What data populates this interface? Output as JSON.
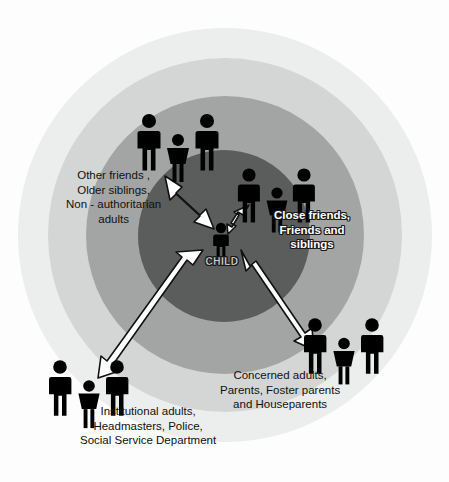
{
  "diagram": {
    "center": {
      "label": "CHILD",
      "icon": "child-figure-icon"
    },
    "rings": [
      {
        "name": "core-ring",
        "fill": "#5b5c5c",
        "order": 1
      },
      {
        "name": "inner-ring",
        "fill": "#a3a5a5",
        "order": 2
      },
      {
        "name": "middle-ring",
        "fill": "#d4d6d6",
        "order": 3
      },
      {
        "name": "outer-ring",
        "fill": "#eceded",
        "order": 4
      }
    ],
    "groups": [
      {
        "id": "close-friends",
        "icon": "people-group-icon",
        "caption_lines": [
          "Close friends,",
          "Friends and",
          "siblings"
        ],
        "ring": "inner-ring"
      },
      {
        "id": "other-friends",
        "icon": "people-group-icon",
        "caption_lines": [
          "Other friends ,",
          "Older siblings,",
          "Non - authoritarian",
          "adults"
        ],
        "ring": "middle-ring"
      },
      {
        "id": "concerned-adults",
        "icon": "people-group-icon",
        "caption_lines": [
          "Concerned adults,",
          "Parents, Foster parents",
          "and Houseparents"
        ],
        "ring": "middle-ring"
      },
      {
        "id": "institutional-adults",
        "icon": "people-group-icon",
        "caption_lines": [
          "Institutional adults,",
          "Headmasters, Police,",
          "Social Service Department"
        ],
        "ring": "outer-ring"
      }
    ],
    "connectors": [
      {
        "name": "arrow-child-to-close-friends",
        "style": "double-headed"
      },
      {
        "name": "arrow-child-to-other-friends",
        "style": "double-headed"
      },
      {
        "name": "arrow-child-to-concerned-adults",
        "style": "double-headed"
      },
      {
        "name": "arrow-child-to-institutional-adults",
        "style": "double-headed"
      }
    ],
    "colors": {
      "arrow_fill": "#ffffff",
      "arrow_stroke": "#111111",
      "figure_fill": "#000000",
      "background": "#ffffff"
    }
  }
}
